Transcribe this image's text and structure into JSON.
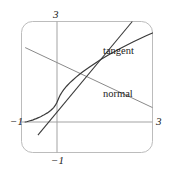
{
  "figure": {
    "title": "",
    "frame_color": "#b9b9b9",
    "axis_color": "#9a9a9a",
    "curve_color": "#3a3a3a",
    "line_color": "#8a8a8a",
    "background": "#ffffff"
  },
  "labels": {
    "y_top": "3",
    "y_bottom": "−1",
    "x_left": "−1",
    "x_right": "3",
    "tangent": "tangent",
    "normal": "normal"
  },
  "chart_data": {
    "type": "line",
    "title": "",
    "xlabel": "",
    "ylabel": "",
    "xlim": [
      -1,
      3
    ],
    "ylim": [
      -1,
      3
    ],
    "grid": false,
    "legend": "inline-annotations",
    "xticks": [
      -1,
      3
    ],
    "yticks": [
      -1,
      3
    ],
    "xtick_labels": [
      "−1",
      "3"
    ],
    "ytick_labels": [
      "−1",
      "3"
    ],
    "annotations": [
      {
        "text": "tangent",
        "x": 2.0,
        "y": 2.0
      },
      {
        "text": "normal",
        "x": 2.0,
        "y": 0.85
      }
    ],
    "series": [
      {
        "name": "curve",
        "kind": "curve",
        "color": "#3a3a3a",
        "points": [
          [
            -1.0,
            -1.0
          ],
          [
            -0.95,
            -0.99
          ],
          [
            -0.9,
            -0.97
          ],
          [
            -0.85,
            -0.95
          ],
          [
            -0.8,
            -0.93
          ],
          [
            -0.75,
            -0.91
          ],
          [
            -0.7,
            -0.88
          ],
          [
            -0.65,
            -0.86
          ],
          [
            -0.6,
            -0.83
          ],
          [
            -0.55,
            -0.8
          ],
          [
            -0.5,
            -0.77
          ],
          [
            -0.45,
            -0.73
          ],
          [
            -0.4,
            -0.7
          ],
          [
            -0.35,
            -0.66
          ],
          [
            -0.3,
            -0.62
          ],
          [
            -0.25,
            -0.57
          ],
          [
            -0.2,
            -0.52
          ],
          [
            -0.15,
            -0.46
          ],
          [
            -0.1,
            -0.39
          ],
          [
            -0.05,
            -0.3
          ],
          [
            0.0,
            -0.18
          ],
          [
            0.05,
            -0.02
          ],
          [
            0.1,
            0.12
          ],
          [
            0.15,
            0.23
          ],
          [
            0.2,
            0.33
          ],
          [
            0.3,
            0.49
          ],
          [
            0.4,
            0.63
          ],
          [
            0.5,
            0.75
          ],
          [
            0.6,
            0.87
          ],
          [
            0.7,
            0.98
          ],
          [
            0.8,
            1.08
          ],
          [
            0.9,
            1.18
          ],
          [
            1.0,
            1.27
          ],
          [
            1.2,
            1.45
          ],
          [
            1.4,
            1.62
          ],
          [
            1.6,
            1.78
          ],
          [
            1.8,
            1.93
          ],
          [
            2.0,
            2.07
          ],
          [
            2.2,
            2.21
          ],
          [
            2.4,
            2.34
          ],
          [
            2.6,
            2.47
          ],
          [
            2.8,
            2.59
          ],
          [
            3.0,
            2.71
          ]
        ]
      },
      {
        "name": "tangent",
        "kind": "line",
        "color": "#3a3a3a",
        "slope": 1.6,
        "points": [
          [
            -0.6,
            -1.55
          ],
          [
            3.0,
            4.2
          ]
        ]
      },
      {
        "name": "normal",
        "kind": "line",
        "color": "#8a8a8a",
        "slope": -0.625,
        "points": [
          [
            -1.0,
            2.1
          ],
          [
            3.0,
            -0.4
          ]
        ]
      }
    ]
  }
}
